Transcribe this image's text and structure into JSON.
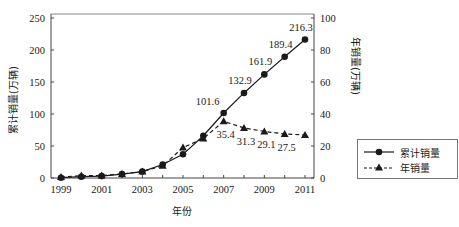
{
  "chart_data": {
    "type": "line",
    "title": "",
    "xlabel": "年份",
    "ylabel": "累计销量(万辆)",
    "y2label": "年销量(万辆)",
    "x": [
      1999,
      2000,
      2001,
      2002,
      2003,
      2004,
      2005,
      2006,
      2007,
      2008,
      2009,
      2010,
      2011
    ],
    "xticks": [
      "1999",
      "2001",
      "2003",
      "2005",
      "2007",
      "2009",
      "2011"
    ],
    "xlim": [
      1999,
      2011
    ],
    "ylim": [
      0,
      250
    ],
    "yticks": [
      0,
      50,
      100,
      150,
      200,
      250
    ],
    "y2lim": [
      0,
      100
    ],
    "y2ticks": [
      0,
      20,
      40,
      60,
      80,
      100
    ],
    "grid": false,
    "legend_position": "right",
    "series": [
      {
        "name": "累计销量",
        "axis": "left",
        "style": "solid",
        "marker": "circle",
        "values": [
          0.5,
          2,
          3,
          6,
          10,
          21,
          37,
          66,
          101.6,
          132.9,
          161.9,
          189.4,
          216.3
        ],
        "labels": {
          "2007": "101.6",
          "2008": "132.9",
          "2009": "161.9",
          "2010": "189.4",
          "2011": "216.3"
        }
      },
      {
        "name": "年销量",
        "axis": "right",
        "style": "dashed",
        "marker": "triangle",
        "values": [
          0.6,
          1.5,
          1.6,
          2.5,
          4,
          7.6,
          19,
          24.7,
          35.4,
          31.3,
          29.1,
          27.5,
          26.9
        ],
        "labels": {
          "2007": "35.4",
          "2008": "31.3",
          "2009": "29.1",
          "2010": "27.5"
        }
      }
    ]
  },
  "legend": {
    "items": [
      {
        "label": "累计销量"
      },
      {
        "label": "年销量"
      }
    ]
  },
  "axes": {
    "xlabel": "年份",
    "ylabel": "累计销量(万辆)",
    "y2label": "年销量(万辆)"
  }
}
